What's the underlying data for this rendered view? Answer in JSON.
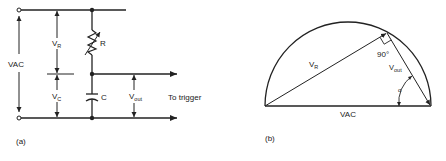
{
  "panel_a": {
    "caption": "(a)",
    "labels": {
      "vac": "VAC",
      "vr_main": "V",
      "vr_sub": "R",
      "vc_main": "V",
      "vc_sub": "C",
      "resistor": "R",
      "capacitor": "C",
      "vout_main": "V",
      "vout_sub": "out",
      "output_note": "To trigger"
    }
  },
  "panel_b": {
    "caption": "(b)",
    "labels": {
      "vr_main": "V",
      "vr_sub": "R",
      "vout_main": "V",
      "vout_sub": "out",
      "right_angle": "90°",
      "angle": "α",
      "base": "VAC"
    }
  },
  "colors": {
    "ink": "#222222",
    "background": "#ffffff"
  }
}
